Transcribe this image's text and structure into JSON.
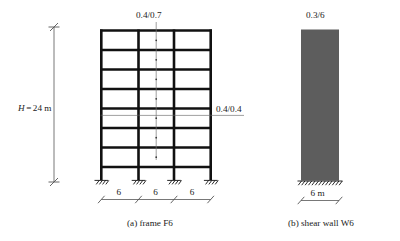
{
  "figure": {
    "height_label": "H",
    "height_eq": "=",
    "height_value": "24 m"
  },
  "frame": {
    "caption": "(a) frame F6",
    "beam_section_label": "0.4/0.7",
    "column_section_label": "0.4/0.4",
    "stories": 8,
    "bays": 3,
    "columns": 4,
    "support_type": "fixed",
    "bay_dims": [
      "6",
      "6",
      "6"
    ],
    "total_height": "24 m"
  },
  "wall": {
    "caption": "(b) shear wall W6",
    "section_label": "0.3/6",
    "width_dim": "6 m",
    "support_type": "fixed",
    "fill_color": "#5d5d5d"
  },
  "colors": {
    "line": "#111111",
    "dimension": "#555555",
    "leader": "#777777",
    "wall": "#5d5d5d",
    "background": "#ffffff"
  }
}
